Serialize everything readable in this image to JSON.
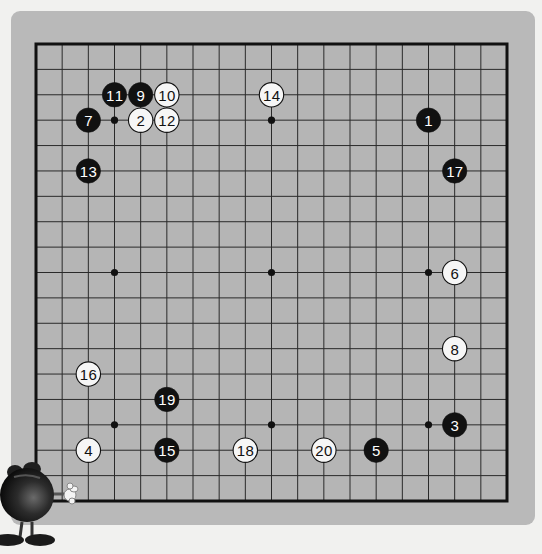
{
  "board": {
    "size": 19,
    "colors": {
      "board_fill": "#b5b5b5",
      "grid_line": "#2a2a2a",
      "border": "#111111",
      "black_stone": "#111111",
      "white_stone": "#f6f6f6",
      "black_label": "#ffffff",
      "white_label": "#111111"
    },
    "hoshi": [
      [
        3,
        3
      ],
      [
        9,
        3
      ],
      [
        15,
        3
      ],
      [
        3,
        9
      ],
      [
        9,
        9
      ],
      [
        15,
        9
      ],
      [
        3,
        15
      ],
      [
        9,
        15
      ],
      [
        15,
        15
      ]
    ],
    "moves": [
      {
        "n": 1,
        "color": "black",
        "col": 15,
        "row": 3
      },
      {
        "n": 2,
        "color": "white",
        "col": 4,
        "row": 3
      },
      {
        "n": 3,
        "color": "black",
        "col": 16,
        "row": 15
      },
      {
        "n": 4,
        "color": "white",
        "col": 2,
        "row": 16
      },
      {
        "n": 5,
        "color": "black",
        "col": 13,
        "row": 16
      },
      {
        "n": 6,
        "color": "white",
        "col": 16,
        "row": 9
      },
      {
        "n": 7,
        "color": "black",
        "col": 2,
        "row": 3
      },
      {
        "n": 8,
        "color": "white",
        "col": 16,
        "row": 12
      },
      {
        "n": 9,
        "color": "black",
        "col": 4,
        "row": 2
      },
      {
        "n": 10,
        "color": "white",
        "col": 5,
        "row": 2
      },
      {
        "n": 11,
        "color": "black",
        "col": 3,
        "row": 2
      },
      {
        "n": 12,
        "color": "white",
        "col": 5,
        "row": 3
      },
      {
        "n": 13,
        "color": "black",
        "col": 2,
        "row": 5
      },
      {
        "n": 14,
        "color": "white",
        "col": 9,
        "row": 2
      },
      {
        "n": 15,
        "color": "black",
        "col": 5,
        "row": 16
      },
      {
        "n": 16,
        "color": "white",
        "col": 2,
        "row": 13
      },
      {
        "n": 17,
        "color": "black",
        "col": 16,
        "row": 5
      },
      {
        "n": 18,
        "color": "white",
        "col": 8,
        "row": 16
      },
      {
        "n": 19,
        "color": "black",
        "col": 5,
        "row": 14
      },
      {
        "n": 20,
        "color": "white",
        "col": 11,
        "row": 16
      }
    ]
  },
  "mascot": {
    "icon": "black-ball-mascot-icon"
  }
}
